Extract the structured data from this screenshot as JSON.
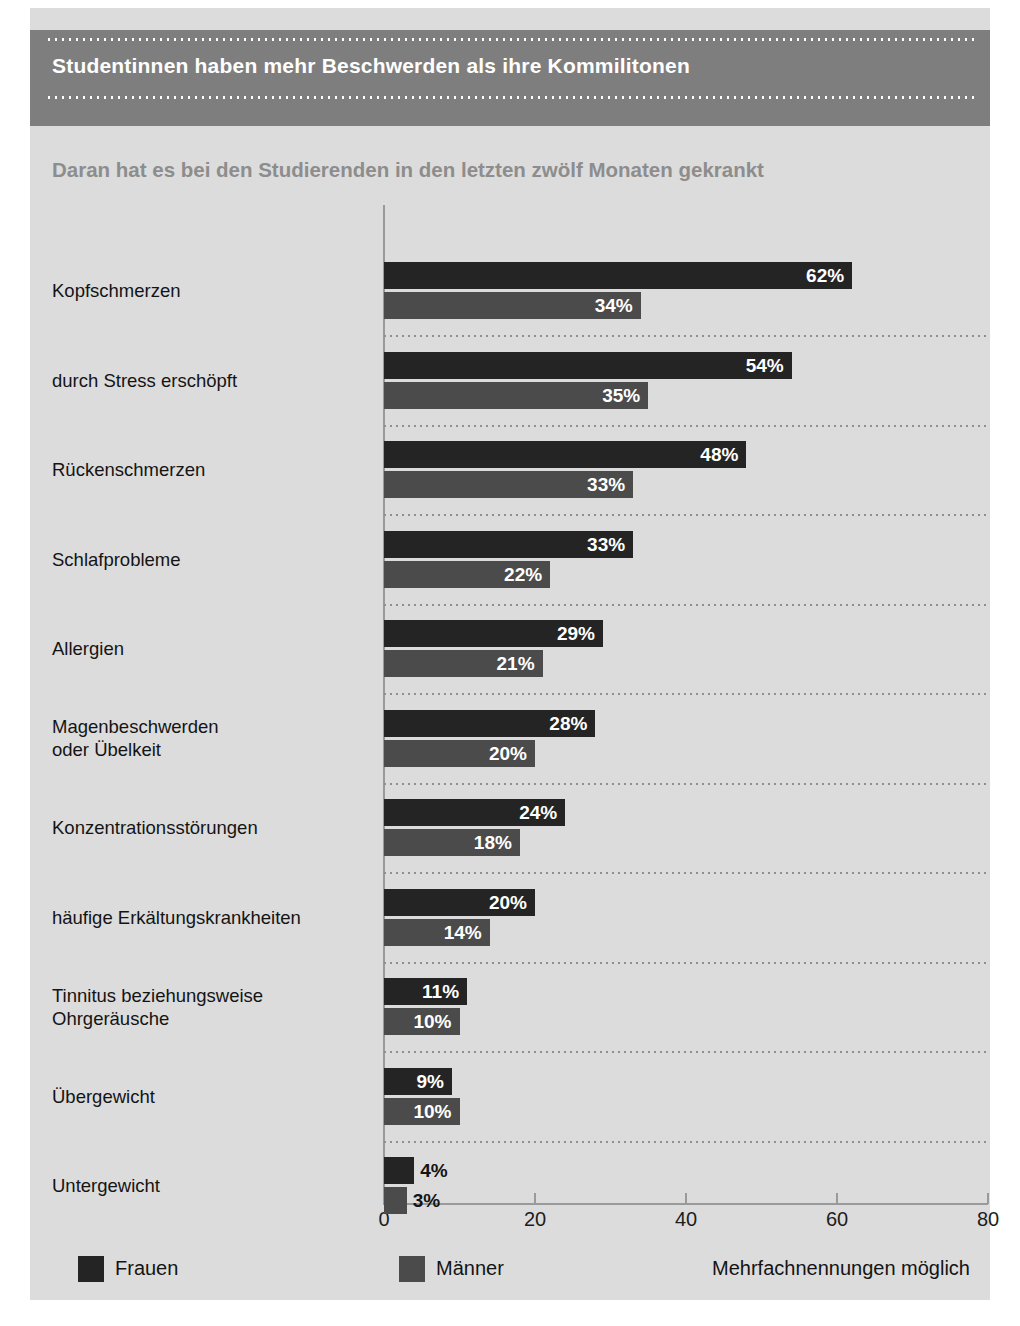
{
  "header": {
    "title": "Studentinnen haben mehr Beschwerden als ihre Kommilitonen",
    "subtitle": "Daran hat es bei den Studierenden in den letzten zwölf Monaten gekrankt"
  },
  "legend": {
    "frauen_label": "Frauen",
    "maenner_label": "Männer",
    "frauen_color": "#242424",
    "maenner_color": "#4b4b4b"
  },
  "footnote": "Mehrfachnennungen möglich",
  "colors": {
    "panel_background": "#dcdcdc",
    "header_band": "#7e7e7e",
    "subtitle_text": "#8d8d8d",
    "axis_line": "#9a9a9a",
    "separator": "#8f8f8f"
  },
  "chart_data": {
    "type": "bar",
    "title": "Studentinnen haben mehr Beschwerden als ihre Kommilitonen",
    "subtitle": "Daran hat es bei den Studierenden in den letzten zwölf Monaten gekrankt",
    "orientation": "horizontal",
    "xlabel": "",
    "ylabel": "",
    "xlim": [
      0,
      80
    ],
    "xticks": [
      0,
      20,
      40,
      60,
      80
    ],
    "xtick_labels": [
      "0",
      "20",
      "40",
      "60",
      "80"
    ],
    "grid": false,
    "legend_position": "bottom",
    "value_suffix": "%",
    "annotation": "Mehrfachnennungen möglich",
    "categories": [
      "Kopfschmerzen",
      "durch Stress erschöpft",
      "Rückenschmerzen",
      "Schlafprobleme",
      "Allergien",
      "Magenbeschwerden\noder Übelkeit",
      "Konzentrationsstörungen",
      "häufige Erkältungskrankheiten",
      "Tinnitus beziehungsweise\nOhrgeräusche",
      "Übergewicht",
      "Untergewicht"
    ],
    "series": [
      {
        "name": "Frauen",
        "color": "#242424",
        "values": [
          62,
          54,
          48,
          33,
          29,
          28,
          24,
          20,
          11,
          9,
          4
        ],
        "labels": [
          "62%",
          "54%",
          "48%",
          "33%",
          "29%",
          "28%",
          "24%",
          "20%",
          "11%",
          "9%",
          "4%"
        ]
      },
      {
        "name": "Männer",
        "color": "#4b4b4b",
        "values": [
          34,
          35,
          33,
          22,
          21,
          20,
          18,
          14,
          10,
          10,
          3
        ],
        "labels": [
          "34%",
          "35%",
          "33%",
          "22%",
          "21%",
          "20%",
          "18%",
          "14%",
          "10%",
          "10%",
          "3%"
        ]
      }
    ]
  }
}
